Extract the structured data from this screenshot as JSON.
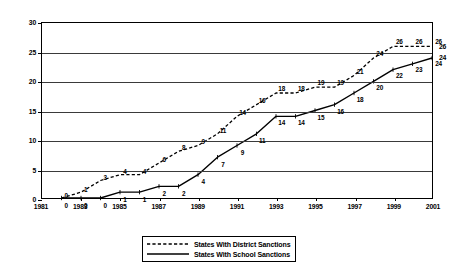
{
  "chart_data": {
    "type": "line",
    "title": "",
    "xlabel": "",
    "ylabel": "",
    "xlim": [
      1981,
      2001
    ],
    "ylim": [
      0,
      30
    ],
    "yticks": [
      0,
      5,
      10,
      15,
      20,
      25,
      30
    ],
    "xticks": [
      1981,
      1983,
      1985,
      1987,
      1989,
      1991,
      1993,
      1995,
      1997,
      1999,
      2001
    ],
    "xtick_labels": [
      "1981",
      "1983",
      "1985",
      "1987",
      "1989",
      "1991",
      "1993",
      "1995",
      "1997",
      "1999",
      "2001"
    ],
    "ytick_labels": [
      "0",
      "5",
      "10",
      "15",
      "20",
      "25",
      "30"
    ],
    "grid": "horizontal",
    "legend_position": "bottom",
    "x": [
      1982,
      1983,
      1984,
      1985,
      1986,
      1987,
      1988,
      1989,
      1990,
      1991,
      1992,
      1993,
      1994,
      1995,
      1996,
      1997,
      1998,
      1999,
      2000,
      2001
    ],
    "series": [
      {
        "name": "States With District Sanctions",
        "style": "dotted",
        "color": "#000000",
        "values": [
          0,
          1,
          3,
          4,
          4,
          6,
          8,
          9,
          11,
          14,
          16,
          18,
          18,
          19,
          19,
          21,
          24,
          26,
          26,
          26
        ],
        "point_labels": [
          "0",
          "1",
          "3",
          "4",
          "4",
          "6",
          "8",
          "9",
          "11",
          "14",
          "16",
          "18",
          "18",
          "19",
          "19",
          "21",
          "24",
          "26",
          "26",
          "26"
        ],
        "end_label": "26"
      },
      {
        "name": "States With School Sanctions",
        "style": "solid",
        "color": "#000000",
        "values": [
          0,
          0,
          0,
          1,
          1,
          2,
          2,
          4,
          7,
          9,
          11,
          14,
          14,
          15,
          16,
          18,
          20,
          22,
          23,
          24
        ],
        "point_labels": [
          "0",
          "0",
          "0",
          "1",
          "1",
          "2",
          "2",
          "4",
          "7",
          "9",
          "11",
          "14",
          "14",
          "15",
          "16",
          "18",
          "20",
          "22",
          "23",
          "24"
        ],
        "end_label": "24"
      }
    ]
  },
  "legend": {
    "items": [
      {
        "label": "States With District Sanctions",
        "style": "dotted"
      },
      {
        "label": "States With School Sanctions",
        "style": "solid"
      }
    ]
  }
}
